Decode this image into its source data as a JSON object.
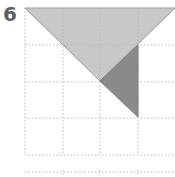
{
  "problem": {
    "number": "6"
  },
  "diagram": {
    "grid": {
      "columns_x": [
        25,
        63,
        100,
        138,
        175
      ],
      "rows_y": [
        8,
        45,
        82,
        118,
        155,
        172
      ],
      "line_color": "#b8b8b8"
    },
    "shapes": [
      {
        "name": "large-light-triangle",
        "points": "25,8 175,8 100,81",
        "fill": "#c8c8c8",
        "stroke": "#9a9a9a"
      },
      {
        "name": "small-dark-triangle",
        "points": "138,45 100,81 138,117",
        "fill": "#8a8a8a",
        "stroke": "#7a7a7a"
      }
    ]
  }
}
